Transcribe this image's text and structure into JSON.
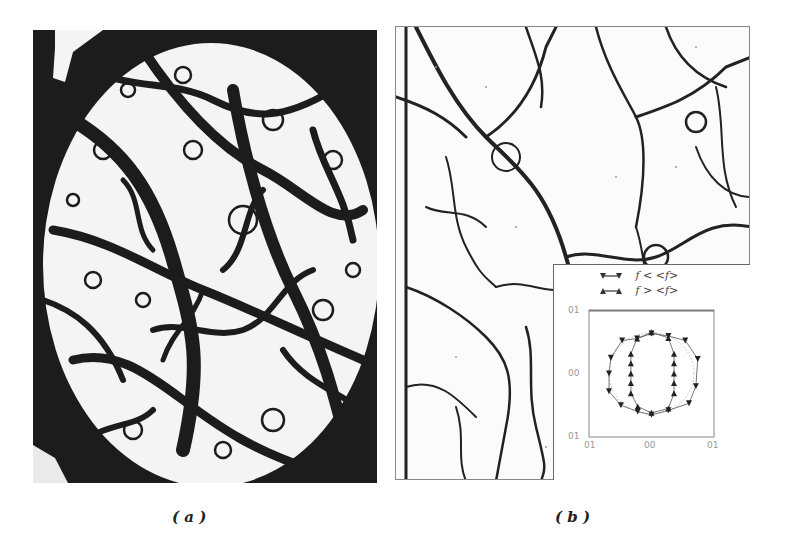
{
  "figure": {
    "panels": [
      {
        "id": "a",
        "caption": "( a )",
        "description": "binarized image with dark fracture/crack network over a white background inside a dark elliptical frame"
      },
      {
        "id": "b",
        "caption": "( b )",
        "description": "thin dark crack network forming polygonal cells on a white background"
      }
    ]
  },
  "inset": {
    "legend": [
      {
        "marker": "down-triangle",
        "label": "f < <f>"
      },
      {
        "marker": "up-triangle",
        "label": "f > <f>"
      }
    ],
    "y_ticks": [
      "0.1",
      "0.0",
      "-0.1"
    ],
    "x_ticks": [
      "-0.1",
      "0.0",
      "0.1"
    ],
    "y_tick_display": [
      "01",
      "00",
      "01"
    ],
    "x_tick_display": [
      "01",
      "00",
      "01"
    ]
  },
  "chart_data": {
    "type": "scatter",
    "title": "",
    "xlabel": "",
    "ylabel": "",
    "xlim": [
      -0.1,
      0.1
    ],
    "ylim": [
      -0.1,
      0.1
    ],
    "grid": false,
    "legend_position": "top (above axes)",
    "x_ticks": [
      -0.1,
      0.0,
      0.1
    ],
    "y_ticks": [
      -0.1,
      0.0,
      0.1
    ],
    "series": [
      {
        "name": "f < <f>",
        "marker": "down-triangle",
        "points": [
          [
            -0.065,
            0.025
          ],
          [
            -0.068,
            0.0
          ],
          [
            -0.068,
            -0.028
          ],
          [
            -0.049,
            -0.05
          ],
          [
            -0.022,
            -0.06
          ],
          [
            0.0,
            -0.065
          ],
          [
            0.027,
            -0.058
          ],
          [
            0.06,
            -0.047
          ],
          [
            0.071,
            -0.02
          ],
          [
            0.074,
            0.023
          ],
          [
            0.054,
            0.052
          ],
          [
            0.027,
            0.059
          ],
          [
            0.0,
            0.063
          ],
          [
            -0.023,
            0.055
          ],
          [
            -0.047,
            0.052
          ]
        ]
      },
      {
        "name": "f > <f>",
        "marker": "up-triangle",
        "points": [
          [
            -0.023,
            0.055
          ],
          [
            -0.033,
            0.031
          ],
          [
            -0.033,
            0.016
          ],
          [
            -0.033,
            0.0
          ],
          [
            -0.033,
            -0.015
          ],
          [
            -0.033,
            -0.031
          ],
          [
            -0.022,
            -0.052
          ],
          [
            0.0,
            -0.062
          ],
          [
            0.027,
            -0.055
          ],
          [
            0.036,
            -0.031
          ],
          [
            0.036,
            -0.015
          ],
          [
            0.036,
            0.0
          ],
          [
            0.036,
            0.016
          ],
          [
            0.036,
            0.031
          ],
          [
            0.027,
            0.056
          ],
          [
            0.0,
            0.065
          ]
        ]
      }
    ]
  }
}
